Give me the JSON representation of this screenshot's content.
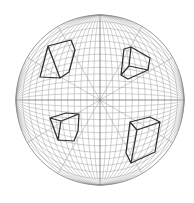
{
  "figure": {
    "sphere": {
      "cx": 100,
      "cy": 100,
      "rx": 84,
      "ry": 85
    },
    "meridian_count": 12,
    "parallel_count": 12,
    "radial_lines_deg": [
      30,
      60,
      120,
      150
    ],
    "colors": {
      "grid": "#a8a8a8",
      "cube": "#2e2e2e",
      "background": "#ffffff"
    },
    "cubes": [
      {
        "name": "cube-top-left",
        "edges": [
          [
            48,
            46
          ],
          [
            71,
            40
          ],
          [
            75,
            50
          ],
          [
            69,
            72
          ],
          [
            60,
            78
          ],
          [
            40,
            77
          ],
          [
            48,
            46
          ],
          null,
          [
            60,
            78
          ],
          [
            48,
            46
          ],
          null,
          [
            60,
            78
          ],
          [
            69,
            72
          ]
        ]
      },
      {
        "name": "cube-top-right",
        "edges": [
          [
            124,
            49
          ],
          [
            131,
            47
          ],
          [
            150,
            58
          ],
          [
            148,
            70
          ],
          [
            128,
            79
          ],
          [
            121,
            75
          ],
          [
            124,
            49
          ],
          null,
          [
            131,
            47
          ],
          [
            129,
            66
          ],
          [
            148,
            70
          ],
          null,
          [
            129,
            66
          ],
          [
            121,
            75
          ]
        ]
      },
      {
        "name": "cube-bottom-left",
        "edges": [
          [
            50,
            118
          ],
          [
            66,
            113
          ],
          [
            79,
            114
          ],
          [
            78,
            131
          ],
          [
            74,
            141
          ],
          [
            58,
            140
          ],
          [
            50,
            118
          ],
          null,
          [
            50,
            118
          ],
          [
            61,
            121
          ],
          [
            79,
            114
          ],
          null,
          [
            61,
            121
          ],
          [
            58,
            140
          ]
        ]
      },
      {
        "name": "cube-bottom-right",
        "edges": [
          [
            130,
            122
          ],
          [
            150,
            117
          ],
          [
            160,
            122
          ],
          [
            155,
            152
          ],
          [
            131,
            163
          ],
          [
            126,
            153
          ],
          [
            130,
            122
          ],
          null,
          [
            130,
            122
          ],
          [
            137,
            130
          ],
          [
            160,
            122
          ],
          null,
          [
            137,
            130
          ],
          [
            131,
            163
          ]
        ]
      }
    ]
  }
}
